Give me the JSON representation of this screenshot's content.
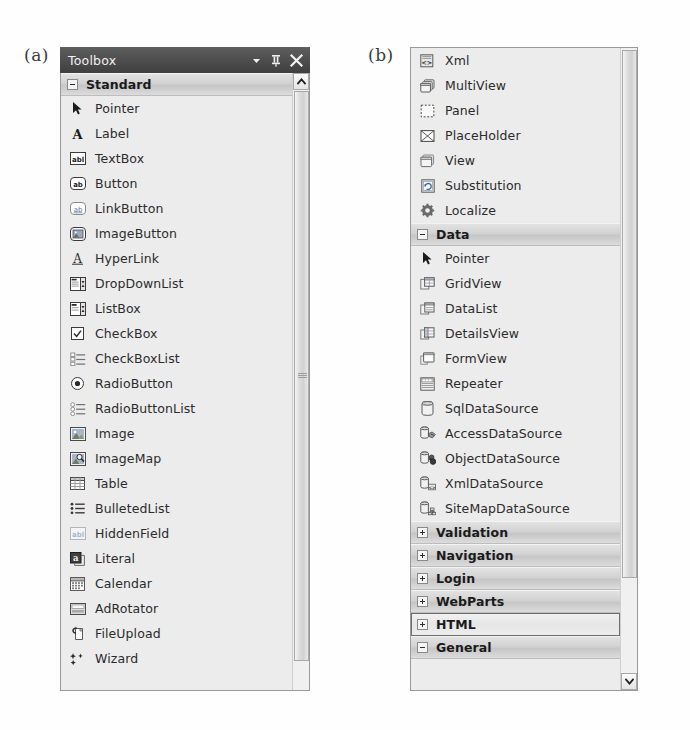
{
  "figure": {
    "label_a": "(a)",
    "label_b": "(b)"
  },
  "panel_a": {
    "titlebar": {
      "title": "Toolbox",
      "dropdown_icon": "chevron-down-icon",
      "pin_icon": "pushpin-icon",
      "close_icon": "close-icon"
    },
    "scrollbar": {
      "up_arrow_icon": "scroll-up-arrow-icon"
    },
    "rows": [
      {
        "type": "category",
        "label": "Standard",
        "expander": "minus",
        "selected": false
      },
      {
        "type": "item",
        "label": "Pointer",
        "icon": "pointer-arrow-icon"
      },
      {
        "type": "item",
        "label": "Label",
        "icon": "label-a-icon"
      },
      {
        "type": "item",
        "label": "TextBox",
        "icon": "textbox-icon"
      },
      {
        "type": "item",
        "label": "Button",
        "icon": "button-icon"
      },
      {
        "type": "item",
        "label": "LinkButton",
        "icon": "linkbutton-icon"
      },
      {
        "type": "item",
        "label": "ImageButton",
        "icon": "imagebutton-icon"
      },
      {
        "type": "item",
        "label": "HyperLink",
        "icon": "hyperlink-icon"
      },
      {
        "type": "item",
        "label": "DropDownList",
        "icon": "dropdownlist-icon"
      },
      {
        "type": "item",
        "label": "ListBox",
        "icon": "listbox-icon"
      },
      {
        "type": "item",
        "label": "CheckBox",
        "icon": "checkbox-icon"
      },
      {
        "type": "item",
        "label": "CheckBoxList",
        "icon": "checkboxlist-icon"
      },
      {
        "type": "item",
        "label": "RadioButton",
        "icon": "radiobutton-icon"
      },
      {
        "type": "item",
        "label": "RadioButtonList",
        "icon": "radiobuttonlist-icon"
      },
      {
        "type": "item",
        "label": "Image",
        "icon": "image-icon"
      },
      {
        "type": "item",
        "label": "ImageMap",
        "icon": "imagemap-icon"
      },
      {
        "type": "item",
        "label": "Table",
        "icon": "table-icon"
      },
      {
        "type": "item",
        "label": "BulletedList",
        "icon": "bulletedlist-icon"
      },
      {
        "type": "item",
        "label": "HiddenField",
        "icon": "hiddenfield-icon"
      },
      {
        "type": "item",
        "label": "Literal",
        "icon": "literal-icon"
      },
      {
        "type": "item",
        "label": "Calendar",
        "icon": "calendar-icon"
      },
      {
        "type": "item",
        "label": "AdRotator",
        "icon": "adrotator-icon"
      },
      {
        "type": "item",
        "label": "FileUpload",
        "icon": "fileupload-icon"
      },
      {
        "type": "item",
        "label": "Wizard",
        "icon": "wizard-icon"
      }
    ]
  },
  "panel_b": {
    "scrollbar": {
      "down_arrow_icon": "scroll-down-arrow-icon"
    },
    "rows": [
      {
        "type": "item",
        "label": "Xml",
        "icon": "xml-icon"
      },
      {
        "type": "item",
        "label": "MultiView",
        "icon": "multiview-icon"
      },
      {
        "type": "item",
        "label": "Panel",
        "icon": "panel-icon"
      },
      {
        "type": "item",
        "label": "PlaceHolder",
        "icon": "placeholder-icon"
      },
      {
        "type": "item",
        "label": "View",
        "icon": "view-icon"
      },
      {
        "type": "item",
        "label": "Substitution",
        "icon": "substitution-icon"
      },
      {
        "type": "item",
        "label": "Localize",
        "icon": "localize-gear-icon"
      },
      {
        "type": "category",
        "label": "Data",
        "expander": "minus",
        "selected": false
      },
      {
        "type": "item",
        "label": "Pointer",
        "icon": "pointer-arrow-icon"
      },
      {
        "type": "item",
        "label": "GridView",
        "icon": "gridview-icon"
      },
      {
        "type": "item",
        "label": "DataList",
        "icon": "datalist-icon"
      },
      {
        "type": "item",
        "label": "DetailsView",
        "icon": "detailsview-icon"
      },
      {
        "type": "item",
        "label": "FormView",
        "icon": "formview-icon"
      },
      {
        "type": "item",
        "label": "Repeater",
        "icon": "repeater-icon"
      },
      {
        "type": "item",
        "label": "SqlDataSource",
        "icon": "sqldatasource-icon"
      },
      {
        "type": "item",
        "label": "AccessDataSource",
        "icon": "accessdatasource-icon"
      },
      {
        "type": "item",
        "label": "ObjectDataSource",
        "icon": "objectdatasource-icon"
      },
      {
        "type": "item",
        "label": "XmlDataSource",
        "icon": "xmldatasource-icon"
      },
      {
        "type": "item",
        "label": "SiteMapDataSource",
        "icon": "sitemapdatasource-icon"
      },
      {
        "type": "category",
        "label": "Validation",
        "expander": "plus",
        "selected": false
      },
      {
        "type": "category",
        "label": "Navigation",
        "expander": "plus",
        "selected": false
      },
      {
        "type": "category",
        "label": "Login",
        "expander": "plus",
        "selected": false
      },
      {
        "type": "category",
        "label": "WebParts",
        "expander": "plus",
        "selected": false
      },
      {
        "type": "category",
        "label": "HTML",
        "expander": "plus",
        "selected": true
      },
      {
        "type": "category",
        "label": "General",
        "expander": "minus",
        "selected": false
      }
    ]
  }
}
